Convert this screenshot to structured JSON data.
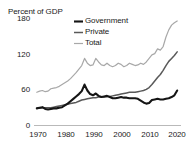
{
  "chart_data": {
    "type": "line",
    "title": "",
    "ylabel": "Percent of GDP",
    "xlabel": "",
    "ylim": [
      0,
      180
    ],
    "xlim": [
      1969,
      2021
    ],
    "yticks": [
      0,
      60,
      120,
      180
    ],
    "xticks": [
      1970,
      1980,
      1990,
      2000,
      2010,
      2020
    ],
    "grid": false,
    "legend_position": "top-center",
    "x": [
      1970,
      1971,
      1972,
      1973,
      1974,
      1975,
      1976,
      1977,
      1978,
      1979,
      1980,
      1981,
      1982,
      1983,
      1984,
      1985,
      1986,
      1987,
      1988,
      1989,
      1990,
      1991,
      1992,
      1993,
      1994,
      1995,
      1996,
      1997,
      1998,
      1999,
      2000,
      2001,
      2002,
      2003,
      2004,
      2005,
      2006,
      2007,
      2008,
      2009,
      2010,
      2011,
      2012,
      2013,
      2014,
      2015,
      2016,
      2017,
      2018,
      2019,
      2020
    ],
    "series": [
      {
        "name": "Government",
        "color": "#151515",
        "width": 2.1,
        "values": [
          28,
          29,
          30,
          27,
          26,
          27,
          28,
          28,
          29,
          30,
          33,
          36,
          40,
          44,
          48,
          52,
          57,
          68,
          58,
          52,
          50,
          53,
          49,
          47,
          48,
          49,
          47,
          45,
          45,
          46,
          47,
          46,
          46,
          45,
          45,
          45,
          44,
          41,
          38,
          36,
          37,
          42,
          43,
          44,
          43,
          43,
          44,
          45,
          47,
          50,
          58
        ]
      },
      {
        "name": "Private",
        "color": "#595959",
        "width": 1.5,
        "values": [
          28,
          28,
          29,
          29,
          29,
          29,
          30,
          31,
          32,
          33,
          34,
          35,
          36,
          37,
          38,
          40,
          42,
          43,
          44,
          45,
          46,
          46,
          47,
          47,
          47,
          48,
          48,
          49,
          50,
          51,
          52,
          53,
          54,
          55,
          55,
          55,
          56,
          57,
          58,
          60,
          63,
          68,
          74,
          80,
          85,
          92,
          100,
          107,
          112,
          117,
          123
        ]
      },
      {
        "name": "Total",
        "color": "#a8a8a8",
        "width": 1.2,
        "values": [
          55,
          57,
          58,
          56,
          57,
          61,
          62,
          63,
          65,
          68,
          71,
          74,
          78,
          83,
          88,
          94,
          100,
          112,
          104,
          100,
          101,
          112,
          106,
          101,
          100,
          104,
          100,
          98,
          100,
          104,
          102,
          98,
          100,
          104,
          102,
          100,
          101,
          104,
          102,
          106,
          112,
          118,
          120,
          128,
          126,
          132,
          148,
          160,
          168,
          172,
          175
        ]
      }
    ]
  },
  "axis": {
    "y_title": "Percent of GDP",
    "yticks": [
      "180",
      "120",
      "60",
      "0"
    ],
    "xticks": [
      "1970",
      "1980",
      "1990",
      "2000",
      "2010",
      "2020"
    ]
  },
  "legend": {
    "items": [
      {
        "label": "Government"
      },
      {
        "label": "Private"
      },
      {
        "label": "Total"
      }
    ]
  }
}
